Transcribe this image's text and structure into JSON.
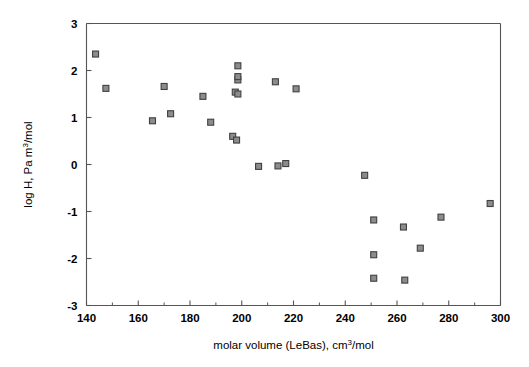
{
  "chart_data": {
    "type": "scatter",
    "title": "",
    "xlabel": "molar volume (LeBas), cm3/mol",
    "xlabel_parts": {
      "pre": "molar volume (LeBas), cm",
      "sup": "3",
      "post": "/mol"
    },
    "ylabel": "log H, Pa m3/mol",
    "ylabel_parts": {
      "pre": "log H, Pa m",
      "sup": "3",
      "post": "/mol"
    },
    "xlim": [
      140,
      300
    ],
    "ylim": [
      -3,
      3
    ],
    "xticks": [
      140,
      160,
      180,
      200,
      220,
      240,
      260,
      280,
      300
    ],
    "xticklabels": [
      "140",
      "160",
      "180",
      "200",
      "220",
      "240",
      "260",
      "280",
      "300"
    ],
    "xminorticks": [
      150,
      170,
      190,
      210,
      230,
      250,
      270,
      290
    ],
    "yticks": [
      -3,
      -2,
      -1,
      0,
      1,
      2,
      3
    ],
    "yticklabels": [
      "-3",
      "-2",
      "-1",
      "0",
      "1",
      "2",
      "3"
    ],
    "grid": false,
    "legend": false,
    "marker": {
      "shape": "square",
      "size": 6,
      "fill": "#8c8c8c",
      "edge": "#404040"
    },
    "series": [
      {
        "name": "data",
        "points": [
          {
            "x": 143.5,
            "y": 2.35
          },
          {
            "x": 147.5,
            "y": 1.62
          },
          {
            "x": 165.5,
            "y": 0.93
          },
          {
            "x": 170.0,
            "y": 1.66
          },
          {
            "x": 172.5,
            "y": 1.08
          },
          {
            "x": 185.0,
            "y": 1.45
          },
          {
            "x": 188.0,
            "y": 0.9
          },
          {
            "x": 196.5,
            "y": 0.6
          },
          {
            "x": 198.0,
            "y": 0.52
          },
          {
            "x": 197.5,
            "y": 1.54
          },
          {
            "x": 198.5,
            "y": 1.5
          },
          {
            "x": 198.5,
            "y": 1.8
          },
          {
            "x": 198.5,
            "y": 1.87
          },
          {
            "x": 198.5,
            "y": 2.1
          },
          {
            "x": 206.5,
            "y": -0.04
          },
          {
            "x": 213.0,
            "y": 1.76
          },
          {
            "x": 214.0,
            "y": -0.03
          },
          {
            "x": 217.0,
            "y": 0.02
          },
          {
            "x": 221.0,
            "y": 1.61
          },
          {
            "x": 247.5,
            "y": -0.23
          },
          {
            "x": 251.0,
            "y": -1.18
          },
          {
            "x": 251.0,
            "y": -1.92
          },
          {
            "x": 251.0,
            "y": -2.42
          },
          {
            "x": 262.5,
            "y": -1.33
          },
          {
            "x": 263.0,
            "y": -2.46
          },
          {
            "x": 269.0,
            "y": -1.78
          },
          {
            "x": 277.0,
            "y": -1.12
          },
          {
            "x": 296.0,
            "y": -0.83
          }
        ]
      }
    ]
  }
}
